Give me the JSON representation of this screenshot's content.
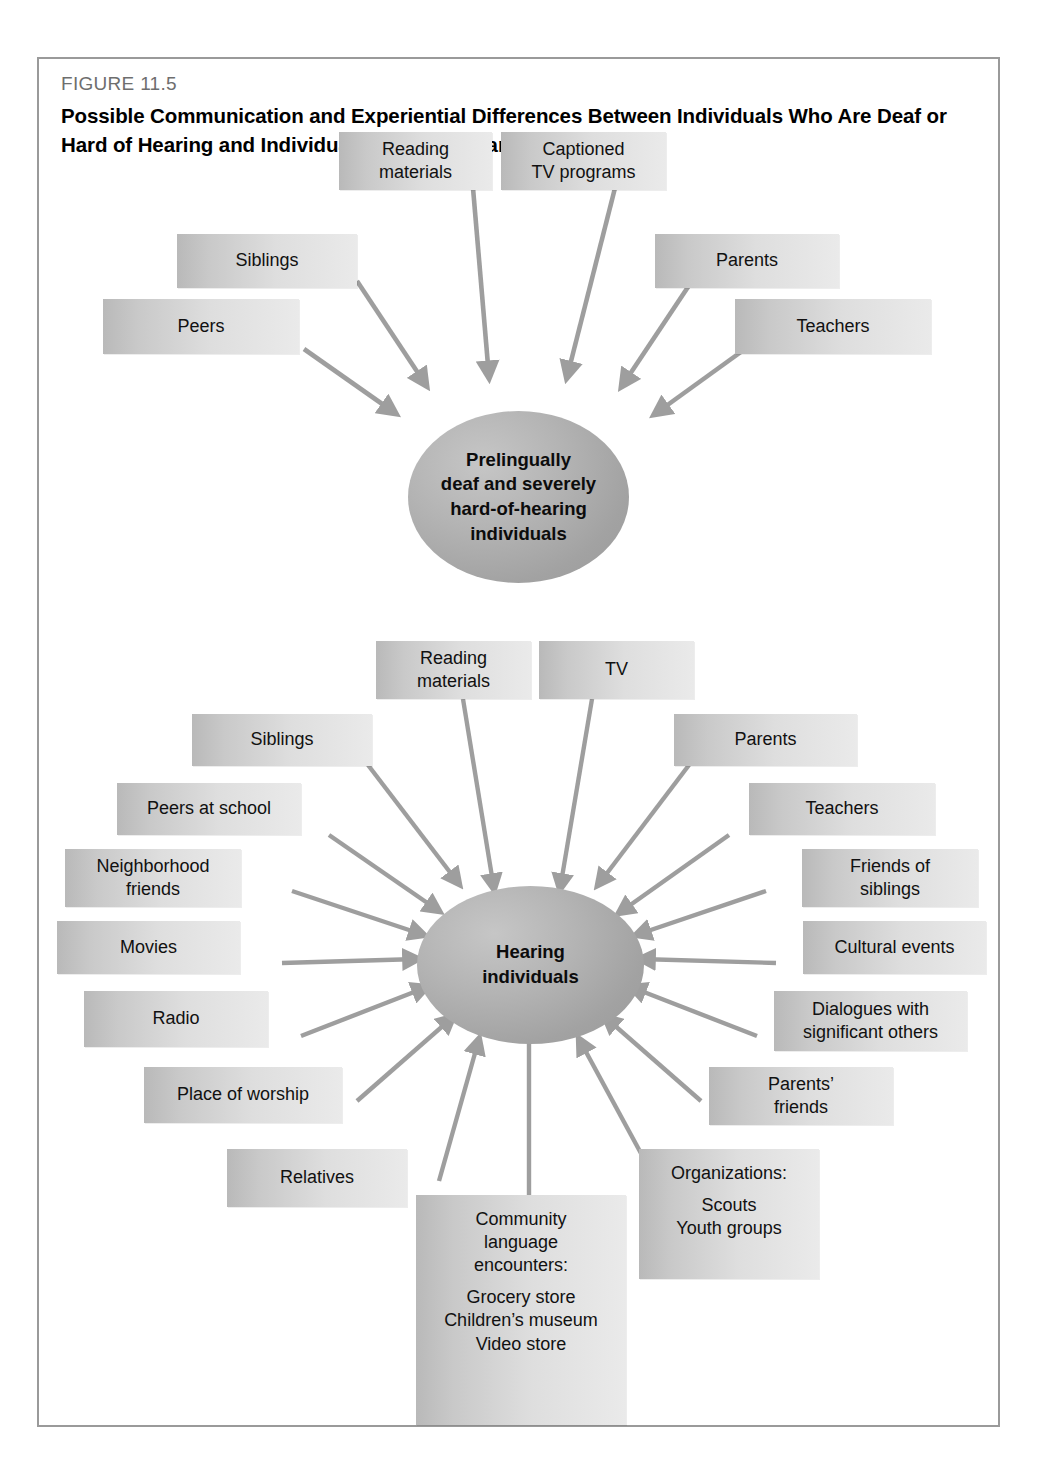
{
  "figure": {
    "number": "FIGURE 11.5",
    "title": "Possible Communication and Experiential Differences Between Individuals Who Are Deaf or Hard of Hearing and Individuals Who Are Hearing"
  },
  "colors": {
    "frame_border": "#9a9a9a",
    "box_fill_dark": "#b9b9b9",
    "box_fill_light": "#eaeaea",
    "hub_fill": "#a8a8a8",
    "arrow": "#9e9e9e",
    "figure_number_text": "#6e6e6e",
    "body_text": "#111111"
  },
  "diagram_top": {
    "hub": {
      "label": "Prelingually deaf and severely hard-of-hearing individuals",
      "lines": [
        "Prelingually",
        "deaf and severely",
        "hard-of-hearing",
        "individuals"
      ]
    },
    "nodes": [
      {
        "id": "reading-materials",
        "lines": [
          "Reading",
          "materials"
        ]
      },
      {
        "id": "captioned-tv-programs",
        "lines": [
          "Captioned",
          "TV programs"
        ]
      },
      {
        "id": "siblings",
        "lines": [
          "Siblings"
        ]
      },
      {
        "id": "parents",
        "lines": [
          "Parents"
        ]
      },
      {
        "id": "peers",
        "lines": [
          "Peers"
        ]
      },
      {
        "id": "teachers",
        "lines": [
          "Teachers"
        ]
      }
    ]
  },
  "diagram_bottom": {
    "hub": {
      "label": "Hearing individuals",
      "lines": [
        "Hearing",
        "individuals"
      ]
    },
    "nodes": [
      {
        "id": "reading-materials",
        "lines": [
          "Reading",
          "materials"
        ]
      },
      {
        "id": "tv",
        "lines": [
          "TV"
        ]
      },
      {
        "id": "siblings",
        "lines": [
          "Siblings"
        ]
      },
      {
        "id": "parents",
        "lines": [
          "Parents"
        ]
      },
      {
        "id": "peers-at-school",
        "lines": [
          "Peers at school"
        ]
      },
      {
        "id": "teachers",
        "lines": [
          "Teachers"
        ]
      },
      {
        "id": "neighborhood-friends",
        "lines": [
          "Neighborhood",
          "friends"
        ]
      },
      {
        "id": "friends-of-siblings",
        "lines": [
          "Friends of",
          "siblings"
        ]
      },
      {
        "id": "movies",
        "lines": [
          "Movies"
        ]
      },
      {
        "id": "cultural-events",
        "lines": [
          "Cultural events"
        ]
      },
      {
        "id": "radio",
        "lines": [
          "Radio"
        ]
      },
      {
        "id": "dialogues-with-significant-others",
        "lines": [
          "Dialogues with",
          "significant others"
        ]
      },
      {
        "id": "place-of-worship",
        "lines": [
          "Place of worship"
        ]
      },
      {
        "id": "parents-friends",
        "lines": [
          "Parents’",
          "friends"
        ]
      },
      {
        "id": "relatives",
        "lines": [
          "Relatives"
        ]
      },
      {
        "id": "community-language-encounters",
        "lines": [
          "Community",
          "language",
          "encounters:"
        ],
        "sub": [
          "Grocery store",
          "Children’s museum",
          "Video store"
        ]
      },
      {
        "id": "organizations",
        "lines": [
          "Organizations:"
        ],
        "sub": [
          "Scouts",
          "Youth groups"
        ]
      }
    ]
  }
}
